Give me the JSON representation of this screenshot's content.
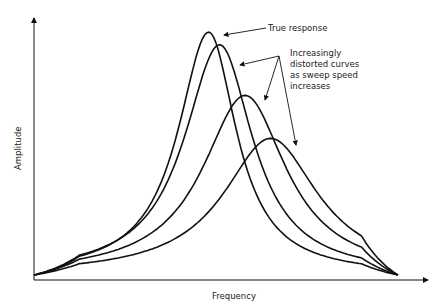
{
  "chart_data": {
    "type": "line",
    "title": "",
    "xlabel": "Frequency",
    "ylabel": "Amplitude",
    "grid": false,
    "legend": "none",
    "series": [
      {
        "name": "True response",
        "peak_x": 0.48,
        "peak_y": 0.96,
        "width": 0.13
      },
      {
        "name": "Distorted curve 1",
        "peak_x": 0.51,
        "peak_y": 0.91,
        "width": 0.15
      },
      {
        "name": "Distorted curve 2",
        "peak_x": 0.58,
        "peak_y": 0.71,
        "width": 0.18
      },
      {
        "name": "Distorted curve 3",
        "peak_x": 0.65,
        "peak_y": 0.54,
        "width": 0.2
      }
    ],
    "annotations": [
      {
        "text": "True response",
        "target": "True response"
      },
      {
        "text": [
          "Increasingly",
          "distorted curves",
          "as sweep speed",
          "increases"
        ],
        "targets": [
          "Distorted curve 1",
          "Distorted curve 2",
          "Distorted curve 3"
        ]
      }
    ]
  },
  "labels": {
    "true_response": "True response",
    "distorted": [
      "Increasingly",
      "distorted curves",
      "as sweep speed",
      "increases"
    ],
    "xlabel": "Frequency",
    "ylabel": "Amplitude"
  },
  "colors": {
    "ink": "#111111"
  }
}
